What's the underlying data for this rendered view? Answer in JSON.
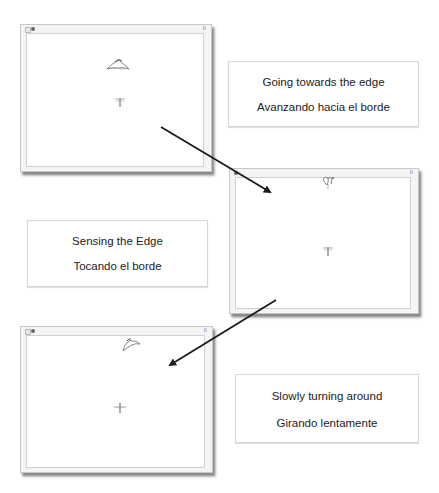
{
  "panels": [
    {
      "id": "step1",
      "window": {
        "pause_label": "II"
      },
      "caption": {
        "en": "Going towards the edge",
        "es": "Avanzando hacia el borde"
      }
    },
    {
      "id": "step2",
      "window": {
        "pause_label": "II"
      },
      "caption": {
        "en": "Sensing the Edge",
        "es": "Tocando el borde"
      }
    },
    {
      "id": "step3",
      "window": {
        "pause_label": "II"
      },
      "caption": {
        "en": "Slowly turning around",
        "es": "Girando lentamente"
      }
    }
  ],
  "icons": {
    "window_grid": "grid-icon",
    "window_dot": "record-dot-icon",
    "pause": "pause-icon",
    "bird_sprite": "bird-sprite-icon",
    "dragonfly_sprite": "dragonfly-sprite-icon"
  },
  "colors": {
    "arrow": "#1a1a1a",
    "window_bg": "#f4f4f4",
    "stage_bg": "#ffffff",
    "caption_border": "#d6d6d6"
  }
}
